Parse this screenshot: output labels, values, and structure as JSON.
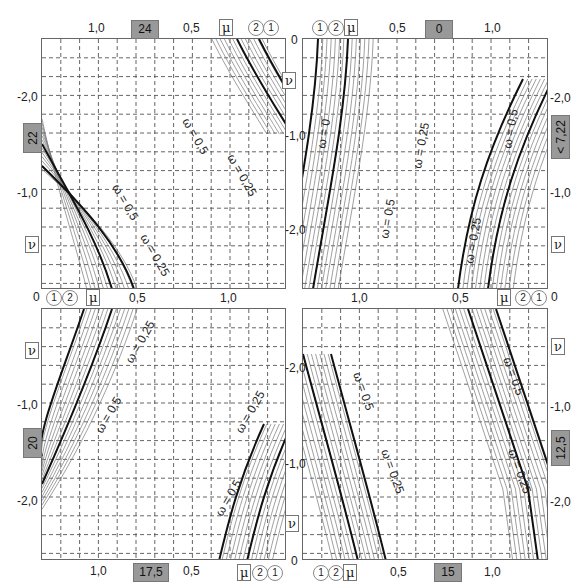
{
  "diagram": {
    "type": "four-quadrant interaction nomogram",
    "colors": {
      "grid": "#555555",
      "curve_bold": "#111111",
      "curve_thin": "#777777",
      "tag_bg": "#999999"
    },
    "symbols": {
      "mu": "μ",
      "nu": "ν"
    },
    "curve_markers": [
      "1",
      "2",
      "3",
      "4",
      "5"
    ],
    "panels": {
      "top_left": {
        "tag_top": "24",
        "tag_side": "22",
        "x_ticks": [
          "1,0",
          "0,5"
        ],
        "y_ticks": [
          "-2,0",
          "-1,0"
        ],
        "origin": "0",
        "omega_labels": [
          "ω = 0,5",
          "ω = 0,25",
          "ω = 0,5",
          "ω = 0,25"
        ],
        "markers": [
          "3",
          "4",
          "3",
          "2",
          "1"
        ]
      },
      "top_right": {
        "tag_top": "0",
        "tag_side": "< 7,22",
        "x_ticks": [
          "0,5",
          "1,0",
          "1,0",
          "0,5"
        ],
        "y_ticks": [
          "-1,0",
          "-2,0",
          "-2,0",
          "-1,0"
        ],
        "origin": "0",
        "omega_labels": [
          "ω = 0",
          "ω = 0,25",
          "ω = 0,5",
          "ω = 0,5",
          "ω = 0,25",
          "ω = 0"
        ],
        "markers": [
          "1",
          "2",
          "3",
          "4",
          "5",
          "5",
          "4",
          "3",
          "2",
          "1"
        ]
      },
      "bottom_left": {
        "tag_side": "20",
        "tag_bottom": "17,5",
        "x_ticks": [
          "0,5",
          "1,0",
          "1,0",
          "0,5"
        ],
        "y_ticks": [
          "-1,0",
          "-2,0"
        ],
        "origin": "0",
        "omega_labels": [
          "ω = 0,25",
          "ω = 0,5",
          "ω = 0,25",
          "ω = 0,5"
        ],
        "markers": [
          "1",
          "2",
          "3",
          "4",
          "4",
          "3",
          "2",
          "1"
        ]
      },
      "bottom_right": {
        "tag_side": "12,5",
        "tag_bottom": "15",
        "x_ticks": [
          "1,0",
          "0,5",
          "0,5",
          "1,0"
        ],
        "y_ticks": [
          "-1,0",
          "-2,0",
          "-2,0",
          "-1,0"
        ],
        "origin": "0",
        "omega_labels": [
          "ω = 0,5",
          "ω = 0,5",
          "ω = 0,25",
          "ω = 0,25"
        ],
        "markers": [
          "3",
          "2",
          "1",
          "4",
          "4",
          "3",
          "5",
          "1",
          "2"
        ]
      }
    }
  }
}
